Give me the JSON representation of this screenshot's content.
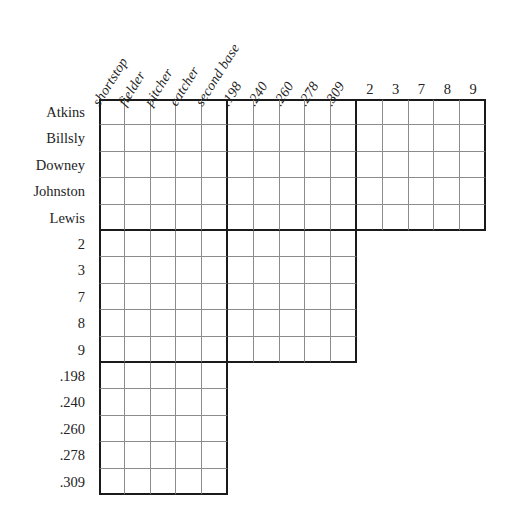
{
  "puzzle": {
    "title": "Logic puzzle grid",
    "background_color": "#ffffff",
    "line_color_thin": "#8c8c8c",
    "line_color_thick": "#1a1a1a",
    "text_color": "#242424",
    "cell_width": 25.8,
    "cell_height": 26.4,
    "grid_origin": {
      "x": 99,
      "y": 99
    },
    "columns": {
      "groups": [
        {
          "name": "positions",
          "orientation": "rotated",
          "labels": [
            "shortstop",
            "fielder",
            "pitcher",
            "catcher",
            "second base"
          ]
        },
        {
          "name": "batting-averages",
          "orientation": "rotated",
          "labels": [
            ".198",
            ".240",
            ".260",
            ".278",
            ".309"
          ]
        },
        {
          "name": "jersey-numbers",
          "orientation": "horizontal",
          "labels": [
            "2",
            "3",
            "7",
            "8",
            "9"
          ]
        }
      ],
      "all": [
        "shortstop",
        "fielder",
        "pitcher",
        "catcher",
        "second base",
        ".198",
        ".240",
        ".260",
        ".278",
        ".309",
        "2",
        "3",
        "7",
        "8",
        "9"
      ]
    },
    "rows": {
      "groups": [
        {
          "name": "players",
          "labels": [
            "Atkins",
            "Billsly",
            "Downey",
            "Johnston",
            "Lewis"
          ],
          "column_span": 15
        },
        {
          "name": "jersey-numbers",
          "labels": [
            "2",
            "3",
            "7",
            "8",
            "9"
          ],
          "column_span": 10
        },
        {
          "name": "batting-averages",
          "labels": [
            ".198",
            ".240",
            ".260",
            ".278",
            ".309"
          ],
          "column_span": 5
        }
      ],
      "all": [
        "Atkins",
        "Billsly",
        "Downey",
        "Johnston",
        "Lewis",
        "2",
        "3",
        "7",
        "8",
        "9",
        ".198",
        ".240",
        ".260",
        ".278",
        ".309"
      ]
    },
    "cells": {
      "all_empty": true,
      "marks": []
    }
  }
}
